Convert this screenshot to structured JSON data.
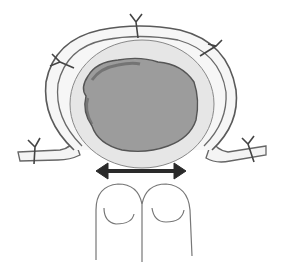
{
  "figure": {
    "colors": {
      "background": "#ffffff",
      "outline": "#555555",
      "ring_fill": "#f2f2f2",
      "inner_fill": "#e4e4e4",
      "lesion_fill": "#9a9a9a",
      "lesion_edge": "#5a5a5a",
      "arrow": "#2a2a2a",
      "suture": "#444444"
    },
    "sutures": [
      {
        "x": 136,
        "y": 18
      },
      {
        "x": 214,
        "y": 46
      },
      {
        "x": 58,
        "y": 60
      },
      {
        "x": 35,
        "y": 145
      },
      {
        "x": 248,
        "y": 142
      }
    ],
    "arrow": {
      "x1": 96,
      "x2": 186,
      "y": 171,
      "direction": "bidirectional"
    },
    "fingers": {
      "count": 2
    }
  }
}
